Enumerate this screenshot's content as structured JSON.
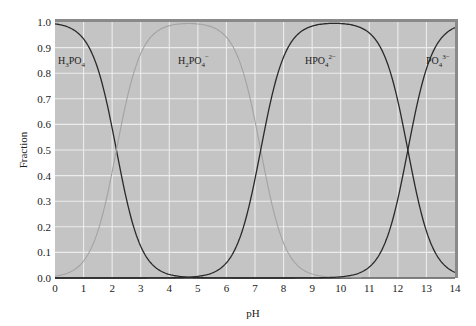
{
  "chart_data": {
    "type": "line",
    "title": "",
    "xlabel": "pH",
    "ylabel": "Fraction",
    "xlim": [
      0,
      14
    ],
    "ylim": [
      0.0,
      1.0
    ],
    "x_ticks": [
      "0",
      "1",
      "2",
      "3",
      "4",
      "5",
      "6",
      "7",
      "8",
      "9",
      "10",
      "11",
      "12",
      "13",
      "14"
    ],
    "y_ticks": [
      "0.0",
      "0.1",
      "0.2",
      "0.3",
      "0.4",
      "0.5",
      "0.6",
      "0.7",
      "0.8",
      "0.9",
      "1.0"
    ],
    "grid": true,
    "legend_position": "inline labels",
    "pKa": [
      2.15,
      7.2,
      12.35
    ],
    "series": [
      {
        "name": "H3PO4",
        "label_html": "H<tspan baseline-shift='sub' font-size='7'>3</tspan>PO<tspan baseline-shift='sub' font-size='7'>4</tspan>",
        "color": "#2a2a2a",
        "species_index": 0,
        "x": [
          0,
          1,
          2,
          2.15,
          3,
          4,
          5,
          6,
          7,
          14
        ],
        "values": [
          0.99,
          0.93,
          0.59,
          0.5,
          0.12,
          0.01,
          0.0,
          0.0,
          0.0,
          0.0
        ]
      },
      {
        "name": "H2PO4-",
        "color": "#9a9a9a",
        "species_index": 1,
        "x": [
          0,
          1,
          2,
          2.15,
          3,
          4,
          4.7,
          6,
          7,
          7.2,
          8,
          9,
          10,
          14
        ],
        "values": [
          0.01,
          0.07,
          0.41,
          0.5,
          0.88,
          0.99,
          1.0,
          0.94,
          0.61,
          0.5,
          0.14,
          0.02,
          0.0,
          0.0
        ]
      },
      {
        "name": "HPO4 2-",
        "color": "#2a2a2a",
        "species_index": 2,
        "x": [
          0,
          4,
          5,
          6,
          7,
          7.2,
          8,
          9,
          9.8,
          11,
          12,
          12.35,
          13,
          14
        ],
        "values": [
          0.0,
          0.0,
          0.01,
          0.06,
          0.39,
          0.5,
          0.86,
          0.98,
          0.99,
          0.96,
          0.69,
          0.5,
          0.18,
          0.02
        ]
      },
      {
        "name": "PO4 3-",
        "color": "#2a2a2a",
        "species_index": 3,
        "x": [
          0,
          9,
          10,
          11,
          12,
          12.35,
          13,
          14
        ],
        "values": [
          0.0,
          0.0,
          0.0,
          0.04,
          0.31,
          0.5,
          0.82,
          0.98
        ]
      }
    ],
    "annotations": [
      {
        "text": "H3PO4",
        "x": 0.3,
        "y": 0.88
      },
      {
        "text": "H2PO4-",
        "x": 4.3,
        "y": 0.88
      },
      {
        "text": "HPO4 2-",
        "x": 9.0,
        "y": 0.88
      },
      {
        "text": "PO4 3-",
        "x": 13.1,
        "y": 0.88
      }
    ]
  },
  "labels": {
    "xlabel": "pH",
    "ylabel": "Fraction",
    "species": [
      {
        "base": "H",
        "sub1": "3",
        "mid": "PO",
        "sub2": "4",
        "sup": ""
      },
      {
        "base": "H",
        "sub1": "2",
        "mid": "PO",
        "sub2": "4",
        "sup": "−"
      },
      {
        "base": "H",
        "sub1": "",
        "mid": "PO",
        "sub2": "4",
        "sup": "2−"
      },
      {
        "base": "",
        "sub1": "",
        "mid": "PO",
        "sub2": "4",
        "sup": "3−"
      }
    ]
  },
  "style": {
    "plot_bg": "#c4c4c4",
    "grid_color": "#ececec",
    "frame_top": "#8a8a8a",
    "frame_right": "#8a8a8a",
    "dark_curve": "#2a2a2a",
    "light_curve": "#a3a3a3"
  }
}
